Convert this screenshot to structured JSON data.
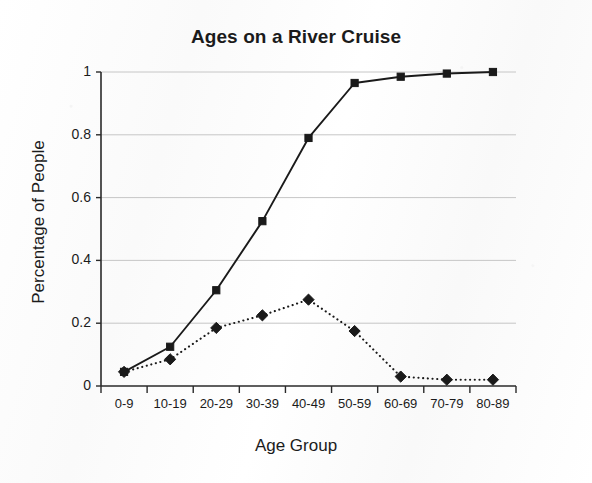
{
  "chart_data": {
    "type": "line",
    "title": "Ages on a River Cruise",
    "xlabel": "Age Group",
    "ylabel": "Percentage of People",
    "categories": [
      "0-9",
      "10-19",
      "20-29",
      "30-39",
      "40-49",
      "50-59",
      "60-69",
      "70-79",
      "80-89"
    ],
    "ylim": [
      0,
      1
    ],
    "ytick_labels": [
      "0",
      "0.2",
      "0.4",
      "0.6",
      "0.8",
      "1"
    ],
    "ytick_values": [
      0,
      0.2,
      0.4,
      0.6,
      0.8,
      1
    ],
    "grid": "horizontal",
    "legend": "none",
    "series": [
      {
        "name": "Cumulative percentage",
        "marker": "square",
        "line_style": "solid",
        "color": "#1a1a1a",
        "values": [
          0.045,
          0.125,
          0.305,
          0.525,
          0.79,
          0.965,
          0.985,
          0.995,
          1.0
        ]
      },
      {
        "name": "Percentage per age group",
        "marker": "diamond",
        "line_style": "dotted",
        "color": "#1a1a1a",
        "values": [
          0.045,
          0.085,
          0.185,
          0.225,
          0.275,
          0.175,
          0.03,
          0.02,
          0.02
        ]
      }
    ]
  }
}
